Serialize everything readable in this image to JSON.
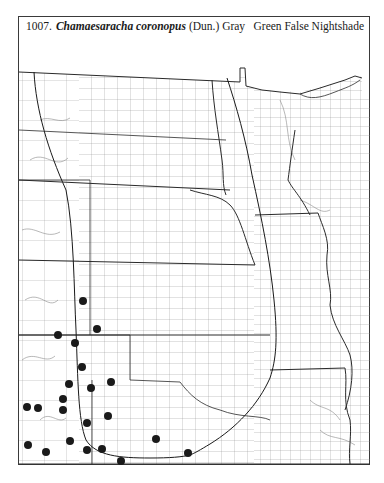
{
  "header": {
    "number": "1007.",
    "scientific_name": "Chamaesaracha coronopus",
    "authority": "(Dun.) Gray",
    "common_name": "Green False Nightshade"
  },
  "map": {
    "region": "Great Plains (North Dakota to Oklahoma, Minnesota to Missouri, Arkansas)",
    "line_color": "#1a1a1a",
    "county_line_color": "#7a7a7a",
    "dot_color": "#1a1a1a",
    "dot_radius": 4,
    "occurrence_dots": [
      {
        "x": 83,
        "y": 301
      },
      {
        "x": 97,
        "y": 329
      },
      {
        "x": 58,
        "y": 335
      },
      {
        "x": 75,
        "y": 343
      },
      {
        "x": 82,
        "y": 367
      },
      {
        "x": 69,
        "y": 384
      },
      {
        "x": 91,
        "y": 388
      },
      {
        "x": 111,
        "y": 382
      },
      {
        "x": 63,
        "y": 399
      },
      {
        "x": 27,
        "y": 407
      },
      {
        "x": 38,
        "y": 408
      },
      {
        "x": 63,
        "y": 410
      },
      {
        "x": 108,
        "y": 416
      },
      {
        "x": 87,
        "y": 423
      },
      {
        "x": 28,
        "y": 445
      },
      {
        "x": 70,
        "y": 441
      },
      {
        "x": 46,
        "y": 452
      },
      {
        "x": 87,
        "y": 450
      },
      {
        "x": 102,
        "y": 449
      },
      {
        "x": 156,
        "y": 439
      },
      {
        "x": 188,
        "y": 453
      },
      {
        "x": 121,
        "y": 461
      }
    ],
    "range_line_west": "M34,72 C36,110 48,150 66,190 C74,230 74,290 76,330 C78,380 78,420 86,440 C96,456 120,458 150,458 C170,458 182,457 190,455",
    "range_line_east": "M227,78 C236,105 246,140 252,175 C262,220 270,260 274,300 C278,340 276,360 270,378 C258,405 236,428 210,444 C200,450 195,453 190,455"
  }
}
